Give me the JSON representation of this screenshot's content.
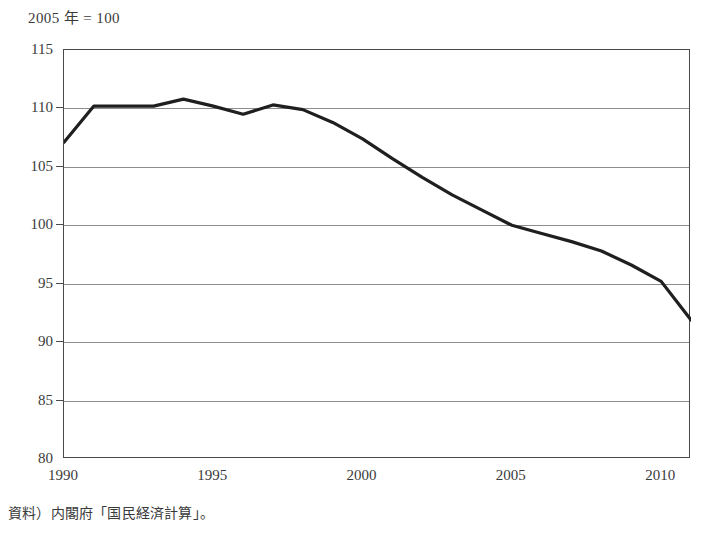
{
  "chart_title": "2005 年 = 100",
  "source_note": "資料）内閣府「国民経済計算」。",
  "axis": {
    "y_ticks": [
      "115",
      "110",
      "105",
      "100",
      "95",
      "90",
      "85",
      "80"
    ],
    "x_ticks": [
      "1990",
      "1995",
      "2000",
      "2005",
      "2010"
    ]
  },
  "style": {
    "line_color": "#1f1f1f",
    "grid_color": "#8d8d8d",
    "frame_color": "#4a4a4a",
    "text_color": "#3a3a3a",
    "background": "#ffffff",
    "line_width": 3.2
  },
  "chart_data": {
    "type": "line",
    "title": "2005 年 = 100",
    "subtitle": "",
    "xlabel": "",
    "ylabel": "",
    "xlim": [
      1990,
      2011
    ],
    "ylim": [
      80,
      115
    ],
    "y_ticks": [
      80,
      85,
      90,
      95,
      100,
      105,
      110,
      115
    ],
    "x_ticks": [
      1990,
      1995,
      2000,
      2005,
      2010
    ],
    "grid": true,
    "legend": "none",
    "x": [
      1990,
      1991,
      1992,
      1993,
      1994,
      1995,
      1996,
      1997,
      1998,
      1999,
      2000,
      2001,
      2002,
      2003,
      2004,
      2005,
      2006,
      2007,
      2008,
      2009,
      2010,
      2011
    ],
    "series": [
      {
        "name": "指数",
        "values": [
          107.1,
          110.2,
          110.2,
          110.2,
          110.8,
          110.2,
          109.5,
          110.3,
          109.9,
          108.8,
          107.4,
          105.7,
          104.1,
          102.6,
          101.3,
          100.0,
          99.3,
          98.6,
          97.8,
          96.6,
          95.2,
          91.9
        ]
      }
    ],
    "annotations": [
      "2005 年 = 100"
    ]
  }
}
